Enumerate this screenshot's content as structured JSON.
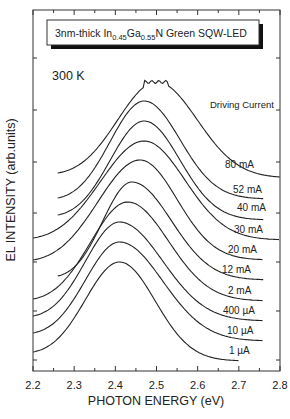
{
  "chart_data": {
    "type": "line",
    "title": "3nm-thick In0.45Ga0.55N Green SQW-LED",
    "title_parts": {
      "pre": "3nm-thick In",
      "sub1": "0.45",
      "mid": "Ga",
      "sub2": "0.55",
      "post": "N  Green SQW-LED"
    },
    "annotation_temp": "300 K",
    "legend_header": "Driving Current",
    "xlabel": "PHOTON ENERGY (eV)",
    "ylabel": "EL INTENSITY (arb.units)",
    "xlim": [
      2.2,
      2.8
    ],
    "x_ticks": [
      "2.2",
      "2.3",
      "2.4",
      "2.5",
      "2.6",
      "2.7",
      "2.8"
    ],
    "y_ticks_shown": false,
    "grid": false,
    "note": "Spectra vertically offset; y values are pixel-offset positions (arb. units)",
    "series": [
      {
        "name": "80 mA",
        "x_start": 2.26,
        "y_start": 173,
        "peak_eV": 2.5,
        "peak_y": 82,
        "x_end": 2.8,
        "y_end": 178,
        "broad": true
      },
      {
        "name": "52 mA",
        "x_start": 2.26,
        "y_start": 198,
        "peak_eV": 2.47,
        "peak_y": 101,
        "x_end": 2.76,
        "y_end": 199
      },
      {
        "name": "40 mA",
        "x_start": 2.26,
        "y_start": 215,
        "peak_eV": 2.47,
        "peak_y": 121,
        "x_end": 2.76,
        "y_end": 220
      },
      {
        "name": "30 mA",
        "x_start": 2.2,
        "y_start": 238,
        "peak_eV": 2.47,
        "peak_y": 141,
        "x_end": 2.8,
        "y_end": 240
      },
      {
        "name": "20 mA",
        "x_start": 2.2,
        "y_start": 260,
        "peak_eV": 2.46,
        "peak_y": 160,
        "x_end": 2.76,
        "y_end": 260
      },
      {
        "name": "12 mA",
        "x_start": 2.26,
        "y_start": 276,
        "peak_eV": 2.44,
        "peak_y": 182,
        "x_end": 2.76,
        "y_end": 280
      },
      {
        "name": "2 mA",
        "x_start": 2.2,
        "y_start": 299,
        "peak_eV": 2.43,
        "peak_y": 202,
        "x_end": 2.76,
        "y_end": 301
      },
      {
        "name": "400 µA",
        "x_start": 2.2,
        "y_start": 316,
        "peak_eV": 2.41,
        "peak_y": 222,
        "x_end": 2.76,
        "y_end": 321
      },
      {
        "name": "10 µA",
        "x_start": 2.2,
        "y_start": 333,
        "peak_eV": 2.41,
        "peak_y": 242,
        "x_end": 2.76,
        "y_end": 341
      },
      {
        "name": "1 µA",
        "x_start": 2.2,
        "y_start": 352,
        "peak_eV": 2.41,
        "peak_y": 262,
        "x_end": 2.7,
        "y_end": 361
      }
    ],
    "labels": [
      {
        "text": "80 mA",
        "x": 225,
        "y": 168
      },
      {
        "text": "52 mA",
        "x": 233,
        "y": 193
      },
      {
        "text": "40 mA",
        "x": 237,
        "y": 211
      },
      {
        "text": "30 mA",
        "x": 234,
        "y": 233
      },
      {
        "text": "20 mA",
        "x": 228,
        "y": 253
      },
      {
        "text": "12 mA",
        "x": 222,
        "y": 273
      },
      {
        "text": "2 mA",
        "x": 228,
        "y": 294
      },
      {
        "text": "400 µA",
        "x": 223,
        "y": 314
      },
      {
        "text": "10 µA",
        "x": 227,
        "y": 334
      },
      {
        "text": "1 µA",
        "x": 229,
        "y": 354
      }
    ]
  }
}
